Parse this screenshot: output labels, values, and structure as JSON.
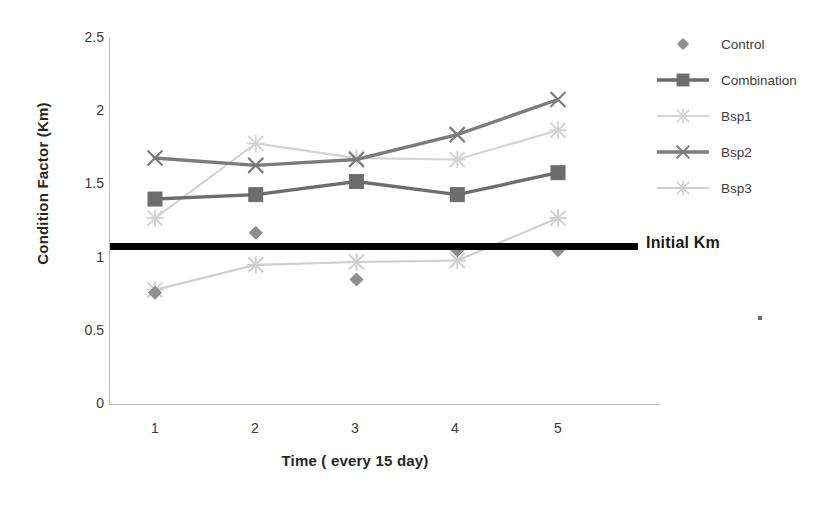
{
  "chart_data": {
    "type": "line",
    "title": "",
    "xlabel": "Time ( every 15 day)",
    "ylabel": "Condition Factor (Km)",
    "x": [
      1,
      2,
      3,
      4,
      5
    ],
    "xtick_labels": [
      "1",
      "2",
      "3",
      "4",
      "5"
    ],
    "ytick_labels": [
      "0",
      "0.5",
      "1",
      "1.5",
      "2",
      "2.5"
    ],
    "ytick_values": [
      0,
      0.5,
      1,
      1.5,
      2,
      2.5
    ],
    "ylim": [
      0,
      2.5
    ],
    "xlim": [
      0.5,
      5.5
    ],
    "grid": false,
    "legend_position": "right",
    "series": [
      {
        "name": "Control",
        "marker": "diamond",
        "color": "#8e8e8e",
        "line": false,
        "values": [
          0.76,
          1.17,
          0.85,
          1.05,
          1.05
        ]
      },
      {
        "name": "Combination",
        "marker": "square",
        "color": "#6d6d6d",
        "line": true,
        "values": [
          1.4,
          1.43,
          1.52,
          1.43,
          1.58
        ]
      },
      {
        "name": "Bsp1",
        "marker": "star",
        "color": "#d4d4d4",
        "line": true,
        "values": [
          1.27,
          1.78,
          1.68,
          1.67,
          1.87
        ]
      },
      {
        "name": "Bsp2",
        "marker": "x",
        "color": "#7c7c7c",
        "line": true,
        "values": [
          1.68,
          1.63,
          1.67,
          1.84,
          2.08
        ]
      },
      {
        "name": "Bsp3",
        "marker": "star",
        "color": "#cfcfcf",
        "line": true,
        "values": [
          0.78,
          0.95,
          0.97,
          0.98,
          1.27
        ]
      }
    ],
    "reference_line": {
      "label": "Initial Km",
      "value": 1.07,
      "color": "#000000"
    }
  },
  "legend": {
    "items": [
      {
        "label": "Control"
      },
      {
        "label": "Combination"
      },
      {
        "label": "Bsp1"
      },
      {
        "label": "Bsp2"
      },
      {
        "label": "Bsp3"
      }
    ]
  },
  "annotations": {
    "initial_km_label": "Initial Km"
  }
}
